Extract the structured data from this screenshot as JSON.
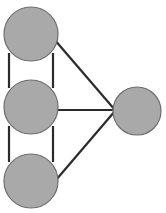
{
  "diagram": {
    "type": "node-link-graph",
    "canvas": {
      "width": 166,
      "height": 213,
      "background": "#ffffff"
    },
    "style": {
      "node_fill": "#a9a9a9",
      "node_stroke": "#6e6e6e",
      "node_stroke_width": 1.2,
      "edge_color": "#2b2b2b",
      "edge_width": 2.2
    },
    "nodes": [
      {
        "id": "n1",
        "label": "",
        "cx": 31,
        "cy": 34,
        "r": 27,
        "column": "left",
        "position": "top"
      },
      {
        "id": "n2",
        "label": "",
        "cx": 31,
        "cy": 107,
        "r": 27,
        "column": "left",
        "position": "middle"
      },
      {
        "id": "n3",
        "label": "",
        "cx": 31,
        "cy": 181,
        "r": 27,
        "column": "left",
        "position": "bottom"
      },
      {
        "id": "n4",
        "label": "",
        "cx": 137,
        "cy": 111,
        "r": 24,
        "column": "right",
        "position": "center"
      }
    ],
    "edges": [
      {
        "id": "e1",
        "from": "n1",
        "to": "n2",
        "kind": "vertical-left",
        "x1": 9,
        "y1": 53,
        "x2": 9,
        "y2": 88
      },
      {
        "id": "e2",
        "from": "n1",
        "to": "n2",
        "kind": "vertical-right",
        "x1": 53,
        "y1": 53,
        "x2": 53,
        "y2": 88
      },
      {
        "id": "e3",
        "from": "n2",
        "to": "n3",
        "kind": "vertical-left",
        "x1": 9,
        "y1": 126,
        "x2": 9,
        "y2": 162
      },
      {
        "id": "e4",
        "from": "n2",
        "to": "n3",
        "kind": "vertical-right",
        "x1": 53,
        "y1": 126,
        "x2": 53,
        "y2": 162
      },
      {
        "id": "e5",
        "from": "n1",
        "to": "n4",
        "kind": "diagonal-down",
        "x1": 54,
        "y1": 39,
        "x2": 115,
        "y2": 110
      },
      {
        "id": "e6",
        "from": "n2",
        "to": "n4",
        "kind": "horizontal",
        "x1": 57,
        "y1": 110,
        "x2": 115,
        "y2": 110
      },
      {
        "id": "e7",
        "from": "n3",
        "to": "n4",
        "kind": "diagonal-up",
        "x1": 56,
        "y1": 180,
        "x2": 115,
        "y2": 111
      }
    ]
  }
}
